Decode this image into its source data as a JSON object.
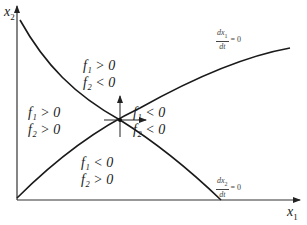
{
  "figure": {
    "type": "phase-plane",
    "axes": {
      "x_label_var": "x",
      "x_label_sub": "1",
      "y_label_var": "x",
      "y_label_sub": "2"
    },
    "nullclines": [
      {
        "id": "dx1dt",
        "num": "dx",
        "num_sub": "1",
        "den": "dt",
        "eq": "= 0",
        "shape": "increasing concave"
      },
      {
        "id": "dx2dt",
        "num": "dx",
        "num_sub": "2",
        "den": "dt",
        "eq": "= 0",
        "shape": "decreasing convex"
      }
    ],
    "regions": [
      {
        "position": "top",
        "line1": "f₁ > 0",
        "line2": "f₂ < 0"
      },
      {
        "position": "left",
        "line1": "f₁ > 0",
        "line2": "f₂ > 0"
      },
      {
        "position": "right",
        "line1": "f₁ < 0",
        "line2": "f₂ < 0"
      },
      {
        "position": "bottom",
        "line1": "f₁ < 0",
        "line2": "f₂ > 0"
      }
    ],
    "equilibrium": {
      "arrows": [
        "up",
        "right"
      ]
    },
    "colors": {
      "line": "#1a1a1a",
      "axis": "#333333",
      "background": "#ffffff"
    }
  }
}
